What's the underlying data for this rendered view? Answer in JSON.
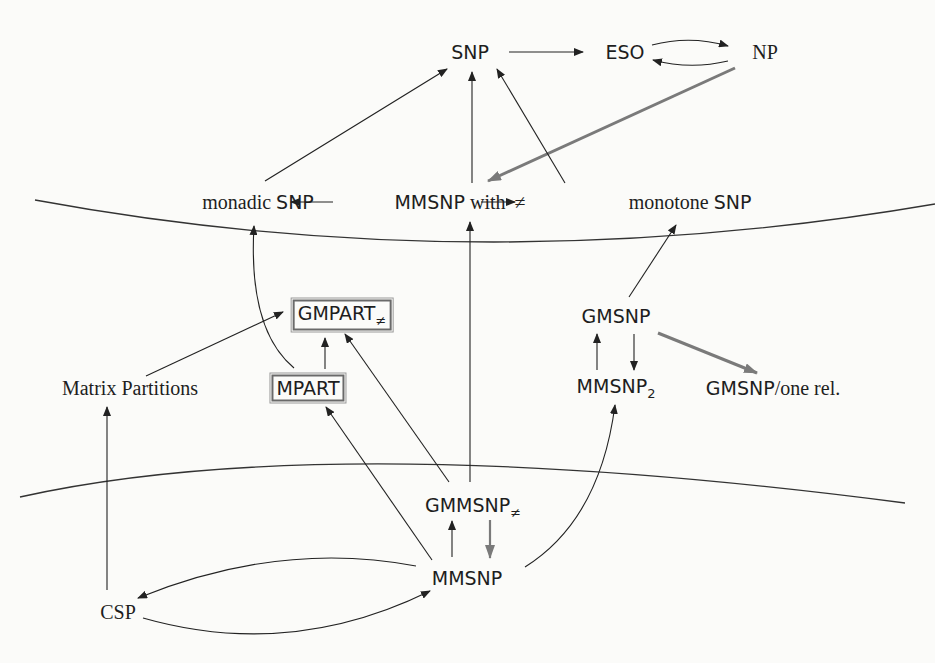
{
  "diagram": {
    "type": "complexity-class-inclusion-diagram",
    "nodes": {
      "snp": {
        "label": "SNP"
      },
      "eso": {
        "label": "ESO"
      },
      "np": {
        "label": "NP"
      },
      "monadic_snp": {
        "prefix": "monadic ",
        "label": "SNP"
      },
      "mmsnp_neq": {
        "label": "MMSNP",
        "suffix": " with ",
        "symbol": "≠"
      },
      "monotone_snp": {
        "prefix": "monotone ",
        "label": "SNP"
      },
      "gmpart_neq": {
        "label": "GMPART",
        "sub": "≠",
        "boxed": true
      },
      "mpart": {
        "label": "MPART",
        "boxed": true
      },
      "matrix_partitions": {
        "label": "Matrix Partitions"
      },
      "gmsnp": {
        "label": "GMSNP"
      },
      "mmsnp2": {
        "label": "MMSNP",
        "sub": "2"
      },
      "gmsnp_one_rel": {
        "label": "GMSNP",
        "suffix": "/one rel."
      },
      "gmmsnp_neq": {
        "label": "GMMSNP",
        "sub": "≠"
      },
      "mmsnp": {
        "label": "MMSNP"
      },
      "csp": {
        "label": "CSP"
      }
    },
    "edges": [
      {
        "from": "SNP",
        "to": "ESO",
        "style": "thin"
      },
      {
        "from": "ESO",
        "to": "NP",
        "style": "thin-curved"
      },
      {
        "from": "NP",
        "to": "ESO",
        "style": "thin-curved"
      },
      {
        "from": "NP",
        "to": "MMSNP with ≠",
        "style": "thick-gray"
      },
      {
        "from": "monadic SNP",
        "to": "SNP",
        "style": "thin"
      },
      {
        "from": "MMSNP with ≠",
        "to": "SNP",
        "style": "thin"
      },
      {
        "from": "monotone SNP",
        "to": "SNP",
        "style": "thin"
      },
      {
        "from": "MMSNP with ≠",
        "to": "monadic SNP",
        "style": "thin"
      },
      {
        "from": "MMSNP with ≠",
        "to": "monotone SNP",
        "style": "thin"
      },
      {
        "from": "MPART",
        "to": "monadic SNP",
        "style": "thin-curved"
      },
      {
        "from": "Matrix Partitions",
        "to": "GMPART≠",
        "style": "thin"
      },
      {
        "from": "MPART",
        "to": "GMPART≠",
        "style": "thin"
      },
      {
        "from": "GMMSNP≠",
        "to": "GMPART≠",
        "style": "thin"
      },
      {
        "from": "GMMSNP≠",
        "to": "MMSNP with ≠",
        "style": "thin"
      },
      {
        "from": "GMSNP",
        "to": "monotone SNP",
        "style": "thin"
      },
      {
        "from": "MMSNP2",
        "to": "GMSNP",
        "style": "thin"
      },
      {
        "from": "GMSNP",
        "to": "MMSNP2",
        "style": "thin"
      },
      {
        "from": "GMSNP",
        "to": "GMSNP/one rel.",
        "style": "thick-gray"
      },
      {
        "from": "MMSNP",
        "to": "MPART",
        "style": "thin"
      },
      {
        "from": "MMSNP",
        "to": "GMMSNP≠",
        "style": "thin"
      },
      {
        "from": "GMMSNP≠",
        "to": "MMSNP",
        "style": "thick-gray"
      },
      {
        "from": "MMSNP",
        "to": "MMSNP2",
        "style": "thin-curved"
      },
      {
        "from": "CSP",
        "to": "Matrix Partitions",
        "style": "thin"
      },
      {
        "from": "MMSNP",
        "to": "CSP",
        "style": "thin-curved"
      },
      {
        "from": "CSP",
        "to": "MMSNP",
        "style": "thin-curved"
      }
    ],
    "separators": 2,
    "colors": {
      "line": "#2a2a2a",
      "thick_arrow": "#7a7a7a",
      "background": "#fbfbf9"
    }
  }
}
